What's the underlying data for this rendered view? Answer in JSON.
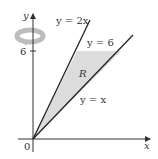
{
  "figure": {
    "axes": {
      "x_label": "x",
      "y_label": "y",
      "origin_label": "0",
      "y_tick_label": "6"
    },
    "curves": [
      {
        "label": "y = 2x"
      },
      {
        "label": "y = x"
      },
      {
        "label": "y = 6"
      }
    ],
    "region_label": "R",
    "icons": {
      "rotation": "rotation-about-y-axis-icon"
    },
    "colors": {
      "region_fill": "#dcdcdc",
      "line": "#222222",
      "rotation_arrow": "#bdbdbd"
    }
  }
}
